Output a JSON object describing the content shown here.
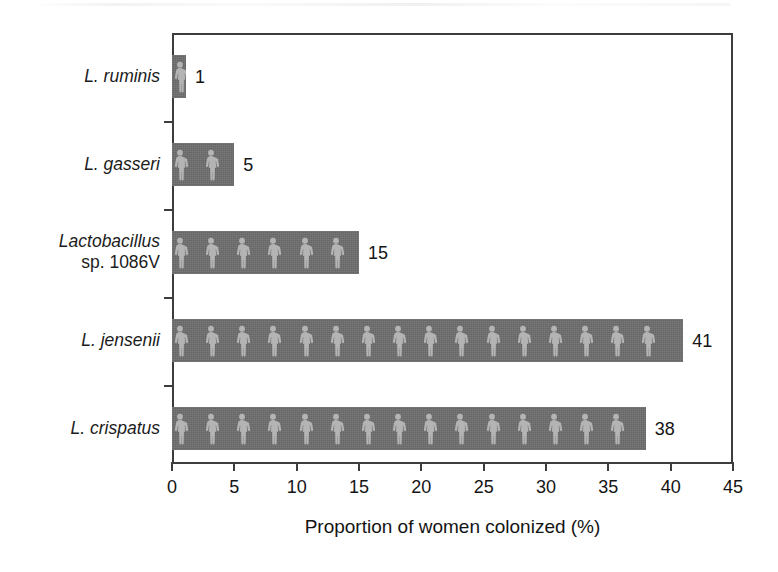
{
  "chart_data": {
    "type": "bar",
    "orientation": "horizontal",
    "title": "",
    "xlabel": "Proportion of women colonized (%)",
    "ylabel": "",
    "xlim": [
      0,
      45
    ],
    "xticks": [
      0,
      5,
      10,
      15,
      20,
      25,
      30,
      35,
      40,
      45
    ],
    "xticklabels": [
      "0",
      "5",
      "10",
      "15",
      "20",
      "25",
      "30",
      "35",
      "40",
      "45"
    ],
    "grid": false,
    "legend": null,
    "categories": [
      "L. ruminis",
      "L. gasseri",
      "Lactobacillus sp. 1086V",
      "L. jensenii",
      "L. crispatus"
    ],
    "values": [
      1,
      5,
      15,
      41,
      38
    ],
    "data_labels": [
      "1",
      "5",
      "15",
      "41",
      "38"
    ],
    "bars": [
      {
        "category": "L. ruminis",
        "label_line1": "L. ruminis",
        "label_line1_style": "italic",
        "label_line2": "",
        "value": 1,
        "value_label": "1",
        "pictogram_count": 1
      },
      {
        "category": "L. gasseri",
        "label_line1": "L. gasseri",
        "label_line1_style": "italic",
        "label_line2": "",
        "value": 5,
        "value_label": "5",
        "pictogram_count": 2
      },
      {
        "category": "Lactobacillus sp. 1086V",
        "label_line1": "Lactobacillus",
        "label_line1_style": "italic",
        "label_line2": "sp. 1086V",
        "value": 15,
        "value_label": "15",
        "pictogram_count": 6
      },
      {
        "category": "L. jensenii",
        "label_line1": "L. jensenii",
        "label_line1_style": "italic",
        "label_line2": "",
        "value": 41,
        "value_label": "41",
        "pictogram_count": 16
      },
      {
        "category": "L. crispatus",
        "label_line1": "L. crispatus",
        "label_line1_style": "italic",
        "label_line2": "",
        "value": 38,
        "value_label": "38",
        "pictogram_count": 15
      }
    ],
    "colors": {
      "bar_fill": "#6e6e6e",
      "pictogram": "#b4b4b4",
      "axis": "#3d3d3d",
      "text": "#141414",
      "background": "#ffffff"
    },
    "pictogram_icon": "person-icon"
  }
}
